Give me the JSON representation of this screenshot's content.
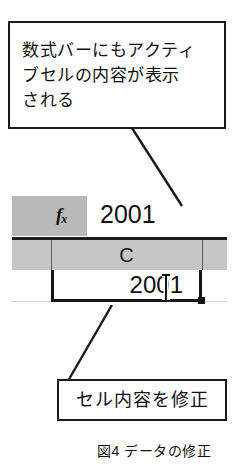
{
  "figure": {
    "caption": "図4 データの修正"
  },
  "callouts": {
    "top": {
      "name": "formula-bar-annotation",
      "lines": [
        "数式バーにもアクティ",
        "ブセルの内容が表示",
        "される"
      ]
    },
    "bottom": {
      "name": "cell-edit-annotation",
      "text": "セル内容を修正"
    }
  },
  "spreadsheet": {
    "formula_bar": {
      "fx_icon": "fx-icon",
      "fx_label": "f",
      "fx_sub": "x",
      "value": "2001"
    },
    "column_header": {
      "label": "C"
    },
    "active_cell": {
      "value": "2001",
      "cursor": "i-beam-text-cursor",
      "fill_handle": "fill-handle"
    }
  },
  "colors": {
    "ink": "#111111",
    "header_gray": "#c6c6c6",
    "formula_gray": "#b9b9b9",
    "border": "#141414",
    "gridline": "#cfcfcf"
  }
}
